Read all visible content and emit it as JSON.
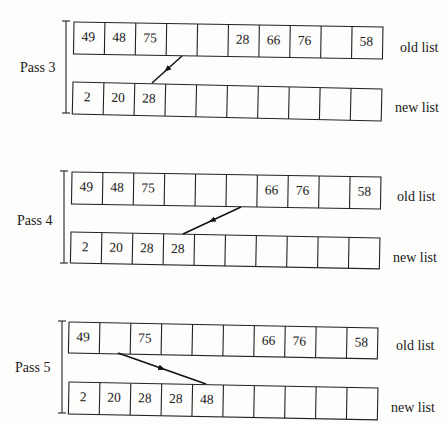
{
  "figure": {
    "passes": [
      {
        "label": "Pass 3",
        "old_list": {
          "label": "old list",
          "cells": [
            "49",
            "48",
            "75",
            "",
            "",
            "28",
            "66",
            "76",
            "",
            "58"
          ]
        },
        "new_list": {
          "label": "new list",
          "cells": [
            "2",
            "20",
            "28",
            "",
            "",
            "",
            "",
            "",
            "",
            ""
          ]
        }
      },
      {
        "label": "Pass 4",
        "old_list": {
          "label": "old list",
          "cells": [
            "49",
            "48",
            "75",
            "",
            "",
            "",
            "66",
            "76",
            "",
            "58"
          ]
        },
        "new_list": {
          "label": "new list",
          "cells": [
            "2",
            "20",
            "28",
            "28",
            "",
            "",
            "",
            "",
            "",
            ""
          ]
        }
      },
      {
        "label": "Pass 5",
        "old_list": {
          "label": "old list",
          "cells": [
            "49",
            "",
            "75",
            "",
            "",
            "",
            "66",
            "76",
            "",
            "58"
          ]
        },
        "new_list": {
          "label": "new list",
          "cells": [
            "2",
            "20",
            "28",
            "28",
            "48",
            "",
            "",
            "",
            "",
            ""
          ]
        }
      }
    ]
  }
}
